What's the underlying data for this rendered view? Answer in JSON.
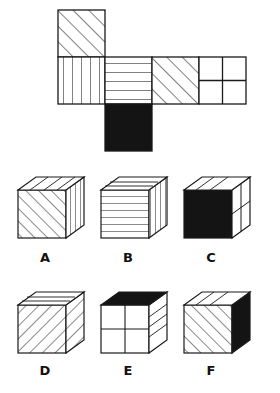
{
  "puzzle": {
    "type": "cube-folding-spatial-reasoning",
    "net": {
      "name": "cube-net",
      "description": "Unfolded cube net in T/cross arrangement",
      "faces": [
        {
          "id": "net-face-top",
          "pattern": "diagonal-stripes-up",
          "row": 0,
          "col": 0
        },
        {
          "id": "net-face-left",
          "pattern": "vertical-stripes",
          "row": 1,
          "col": 0
        },
        {
          "id": "net-face-center",
          "pattern": "horizontal-stripes",
          "row": 1,
          "col": 1
        },
        {
          "id": "net-face-right",
          "pattern": "diagonal-stripes-up",
          "row": 1,
          "col": 2
        },
        {
          "id": "net-face-far-right",
          "pattern": "quad-grid",
          "row": 1,
          "col": 3
        },
        {
          "id": "net-face-bottom",
          "pattern": "solid-black",
          "row": 2,
          "col": 1
        }
      ]
    },
    "options": [
      {
        "id": "option-a",
        "label": "A",
        "faces": {
          "front": "diagonal-stripes-up",
          "side": "vertical-stripes",
          "top": "diagonal-stripes-up"
        }
      },
      {
        "id": "option-b",
        "label": "B",
        "faces": {
          "front": "horizontal-stripes",
          "side": "vertical-stripes",
          "top": "horizontal-stripes"
        }
      },
      {
        "id": "option-c",
        "label": "C",
        "faces": {
          "front": "solid-black",
          "side": "quad-grid",
          "top": "diagonal-stripes-up"
        }
      },
      {
        "id": "option-d",
        "label": "D",
        "faces": {
          "front": "diagonal-stripes-down",
          "side": "diagonal-stripes-down",
          "top": "horizontal-stripes"
        }
      },
      {
        "id": "option-e",
        "label": "E",
        "faces": {
          "front": "quad-grid",
          "side": "horizontal-stripes",
          "top": "solid-black"
        }
      },
      {
        "id": "option-f",
        "label": "F",
        "faces": {
          "front": "diagonal-stripes-up",
          "side": "solid-black",
          "top": "diagonal-stripes-up"
        }
      }
    ]
  },
  "colors": {
    "stroke": "#1a1a1a",
    "fill_white": "#ffffff",
    "fill_black": "#141414",
    "background": "#ffffff",
    "letter": "#111111"
  }
}
